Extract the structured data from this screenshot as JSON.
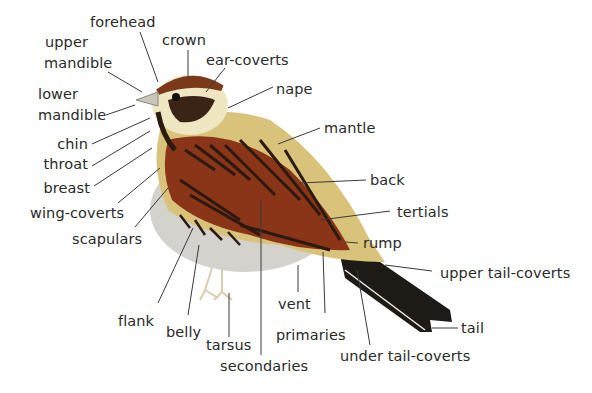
{
  "diagram": {
    "type": "bird topography",
    "labels": {
      "forehead": "forehead",
      "crown": "crown",
      "upper_mandible_1": "upper",
      "upper_mandible_2": "mandible",
      "ear_coverts": "ear-coverts",
      "lower_mandible_1": "lower",
      "lower_mandible_2": "mandible",
      "nape": "nape",
      "mantle": "mantle",
      "chin": "chin",
      "throat": "throat",
      "breast": "breast",
      "back": "back",
      "wing_coverts": "wing-coverts",
      "tertials": "tertials",
      "scapulars": "scapulars",
      "rump": "rump",
      "upper_tail_coverts": "upper tail-coverts",
      "flank": "flank",
      "vent": "vent",
      "belly": "belly",
      "primaries": "primaries",
      "tail": "tail",
      "tarsus": "tarsus",
      "under_tail_coverts": "under tail-coverts",
      "secondaries": "secondaries"
    },
    "colors": {
      "leader_line": "#3a3a3a",
      "label_text": "#2a2a2a",
      "plumage_rufous": "#8a3418",
      "plumage_dark": "#2a1a10",
      "plumage_buff": "#d9c27a",
      "plumage_cream": "#efe6c2",
      "underparts_grey": "#d4d2cc",
      "tail_black": "#1e1a16"
    }
  }
}
